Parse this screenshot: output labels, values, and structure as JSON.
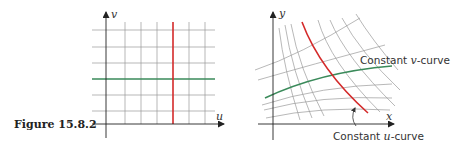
{
  "figure": {
    "caption": "Figure 15.8.2",
    "left_panel": {
      "x_axis_label": "u",
      "y_axis_label": "v",
      "highlight_vertical_color": "#d42a2a",
      "highlight_horizontal_color": "#3a8a5a",
      "grid_color": "#9a9a9a"
    },
    "right_panel": {
      "x_axis_label": "x",
      "y_axis_label": "y",
      "v_curve_label_prefix": "Constant ",
      "v_curve_label_var": "v",
      "v_curve_label_suffix": "-curve",
      "u_curve_label_prefix": "Constant ",
      "u_curve_label_var": "u",
      "u_curve_label_suffix": "-curve",
      "u_curve_color": "#d42a2a",
      "v_curve_color": "#3a8a5a",
      "grid_color": "#9a9a9a"
    }
  }
}
